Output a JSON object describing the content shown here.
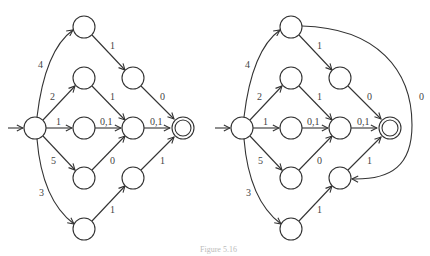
{
  "figure": {
    "caption": "Figure 5.16",
    "diagrams": [
      {
        "id": "left",
        "description": "Finite automaton without back edge",
        "start_state": "S",
        "accepting_states": [
          "F"
        ],
        "states": [
          "S",
          "A",
          "B",
          "C",
          "D",
          "E",
          "G",
          "H",
          "I",
          "F"
        ],
        "edges": [
          {
            "from": "S",
            "to": "A",
            "label": "4"
          },
          {
            "from": "S",
            "to": "B",
            "label": "2"
          },
          {
            "from": "S",
            "to": "C",
            "label": "1"
          },
          {
            "from": "S",
            "to": "D",
            "label": "5"
          },
          {
            "from": "S",
            "to": "E",
            "label": "3"
          },
          {
            "from": "A",
            "to": "G",
            "label": "1"
          },
          {
            "from": "B",
            "to": "H",
            "label": "1"
          },
          {
            "from": "C",
            "to": "H",
            "label": "0,1"
          },
          {
            "from": "D",
            "to": "H",
            "label": "0"
          },
          {
            "from": "E",
            "to": "I",
            "label": "1"
          },
          {
            "from": "G",
            "to": "F",
            "label": "0"
          },
          {
            "from": "H",
            "to": "F",
            "label": "0,1"
          },
          {
            "from": "I",
            "to": "F",
            "label": "1"
          }
        ]
      },
      {
        "id": "right",
        "description": "Same automaton with additional edge from A to I",
        "start_state": "S",
        "accepting_states": [
          "F"
        ],
        "states": [
          "S",
          "A",
          "B",
          "C",
          "D",
          "E",
          "G",
          "H",
          "I",
          "F"
        ],
        "edges": [
          {
            "from": "S",
            "to": "A",
            "label": "4"
          },
          {
            "from": "S",
            "to": "B",
            "label": "2"
          },
          {
            "from": "S",
            "to": "C",
            "label": "1"
          },
          {
            "from": "S",
            "to": "D",
            "label": "5"
          },
          {
            "from": "S",
            "to": "E",
            "label": "3"
          },
          {
            "from": "A",
            "to": "G",
            "label": "1"
          },
          {
            "from": "B",
            "to": "H",
            "label": "1"
          },
          {
            "from": "C",
            "to": "H",
            "label": "0,1"
          },
          {
            "from": "D",
            "to": "H",
            "label": "0"
          },
          {
            "from": "E",
            "to": "I",
            "label": "1"
          },
          {
            "from": "G",
            "to": "F",
            "label": "0"
          },
          {
            "from": "H",
            "to": "F",
            "label": "0,1"
          },
          {
            "from": "I",
            "to": "F",
            "label": "1"
          },
          {
            "from": "A",
            "to": "I",
            "label": "0"
          }
        ]
      }
    ],
    "labels": {
      "l_SA": "4",
      "l_SB": "2",
      "l_SC": "1",
      "l_SD": "5",
      "l_SE": "3",
      "l_AG": "1",
      "l_BH": "1",
      "l_CH": "0,1",
      "l_DH": "0",
      "l_EI": "1",
      "l_GF": "0",
      "l_HF": "0,1",
      "l_IF": "1",
      "l_AI": "0"
    }
  }
}
